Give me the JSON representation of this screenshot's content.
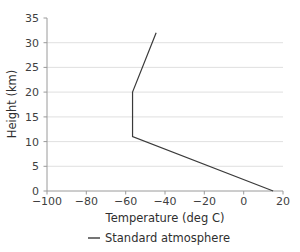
{
  "chart_data": {
    "type": "line",
    "title": "",
    "xlabel": "Temperature (deg C)",
    "ylabel": "Height (km)",
    "xlim": [
      -100,
      20
    ],
    "ylim": [
      0,
      35
    ],
    "xticks": [
      -100,
      -80,
      -60,
      -40,
      -20,
      0,
      20
    ],
    "xtick_labels": [
      "−100",
      "−80",
      "−60",
      "−40",
      "−20",
      "0",
      "20"
    ],
    "yticks": [
      0,
      5,
      10,
      15,
      20,
      25,
      30,
      35
    ],
    "ytick_labels": [
      "0",
      "5",
      "10",
      "15",
      "20",
      "25",
      "30",
      "35"
    ],
    "grid": "horizontal",
    "legend_position": "below-axis-center",
    "series": [
      {
        "name": "Standard atmosphere",
        "color": "#3a3a3a",
        "x": [
          15,
          -56.5,
          -56.5,
          -44.5
        ],
        "y": [
          0,
          11,
          20,
          32
        ],
        "points": [
          {
            "temperature_c": 15,
            "height_km": 0
          },
          {
            "temperature_c": -56.5,
            "height_km": 11
          },
          {
            "temperature_c": -56.5,
            "height_km": 20
          },
          {
            "temperature_c": -44.5,
            "height_km": 32
          }
        ]
      }
    ]
  },
  "legend": {
    "entries": [
      {
        "label": "Standard atmosphere",
        "marker": "line-swatch"
      }
    ]
  }
}
